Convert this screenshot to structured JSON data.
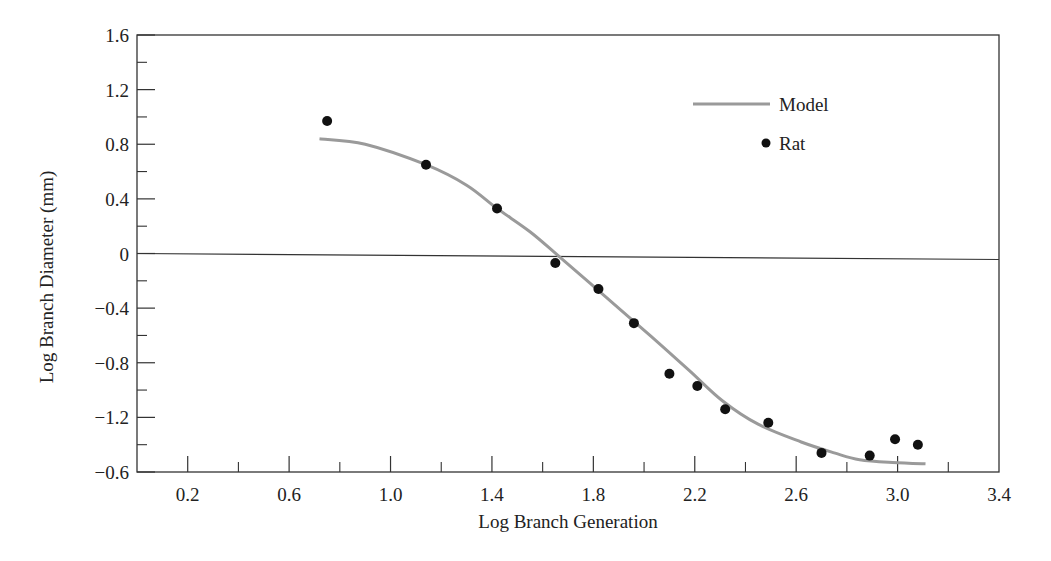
{
  "chart_data": {
    "type": "line",
    "title": "",
    "xlabel": "Log Branch Generation",
    "ylabel": "Log Branch Diameter (mm)",
    "xlim": [
      0.0,
      3.4
    ],
    "ylim": [
      -1.6,
      1.6
    ],
    "x_ticks": [
      0.2,
      0.6,
      1.0,
      1.4,
      1.8,
      2.2,
      2.6,
      3.0,
      3.4
    ],
    "x_tick_labels": [
      "0.2",
      "0.6",
      "1.0",
      "1.4",
      "1.8",
      "2.2",
      "2.6",
      "3.0",
      "3.4"
    ],
    "x_minor_ticks": [
      0.4,
      0.8,
      1.2,
      1.6,
      2.0,
      2.4,
      2.8,
      3.2
    ],
    "y_ticks": [
      1.6,
      1.2,
      0.8,
      0.4,
      0,
      -0.4,
      -0.8,
      -1.2,
      -1.6
    ],
    "y_tick_labels": [
      "1.6",
      "1.2",
      "0.8",
      "0.4",
      "0",
      "−0.4",
      "−0.8",
      "−1.2",
      "−0.6"
    ],
    "y_minor_ticks": [
      1.4,
      1.0,
      0.6,
      0.2,
      -0.2,
      -0.6,
      -1.0,
      -1.4
    ],
    "zero_line": true,
    "grid": false,
    "legend_position": "upper right",
    "series": [
      {
        "name": "Model",
        "kind": "line",
        "color": "#9a9a9a",
        "x": [
          0.72,
          0.9,
          1.14,
          1.3,
          1.42,
          1.55,
          1.67,
          1.85,
          2.03,
          2.18,
          2.31,
          2.45,
          2.62,
          2.75,
          2.85,
          2.98,
          3.11
        ],
        "y": [
          0.84,
          0.8,
          0.65,
          0.5,
          0.33,
          0.16,
          -0.03,
          -0.32,
          -0.61,
          -0.86,
          -1.08,
          -1.25,
          -1.38,
          -1.46,
          -1.51,
          -1.53,
          -1.54
        ]
      },
      {
        "name": "Rat",
        "kind": "scatter",
        "color": "#111111",
        "x": [
          0.75,
          1.14,
          1.42,
          1.65,
          1.82,
          1.96,
          2.1,
          2.21,
          2.32,
          2.49,
          2.7,
          2.89,
          2.99,
          3.08
        ],
        "y": [
          0.97,
          0.65,
          0.33,
          -0.07,
          -0.26,
          -0.51,
          -0.88,
          -0.97,
          -1.14,
          -1.24,
          -1.46,
          -1.48,
          -1.36,
          -1.4
        ]
      }
    ]
  },
  "legend": {
    "model_label": "Model",
    "rat_label": "Rat"
  },
  "axes": {
    "xlabel": "Log Branch Generation",
    "ylabel": "Log Branch Diameter (mm)"
  }
}
